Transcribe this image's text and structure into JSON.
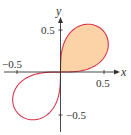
{
  "chart_data": {
    "type": "line",
    "title": "",
    "curve": "lemniscate r^2 = c^2 sin(2θ)",
    "c": 0.69,
    "shaded_region": "first-quadrant loop",
    "xlabel": "x",
    "ylabel": "y",
    "xlim": [
      -0.65,
      0.65
    ],
    "ylim": [
      -0.72,
      0.78
    ],
    "x_ticks": [
      -0.5,
      0.5
    ],
    "y_ticks": [
      0.5,
      -0.5
    ],
    "tick_labels": {
      "x_neg": "−0.5",
      "x_pos": "0.5",
      "y_pos": "0.5",
      "y_neg": "−0.5"
    },
    "grid": false,
    "colors": {
      "curve": "#d9364a",
      "fill": "#fbd3a6",
      "axis": "#333333"
    }
  },
  "labels": {
    "x": "x",
    "y": "y",
    "xneg": "−0.5",
    "xpos": "0.5",
    "ypos": "0.5",
    "yneg": "−0.5"
  }
}
